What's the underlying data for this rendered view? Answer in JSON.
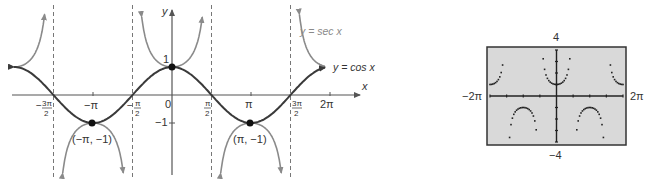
{
  "left_graph": {
    "axis_labels": {
      "x": "x",
      "y": "y"
    },
    "x_tick_labels": [
      {
        "num": "3π",
        "den": "2",
        "sign": "−",
        "value": "-3π/2"
      },
      {
        "text": "−π",
        "value": "-π"
      },
      {
        "num": "π",
        "den": "2",
        "sign": "−",
        "value": "-π/2"
      },
      {
        "text": "0",
        "value": "0"
      },
      {
        "num": "π",
        "den": "2",
        "sign": "",
        "value": "π/2"
      },
      {
        "text": "π",
        "value": "π"
      },
      {
        "num": "3π",
        "den": "2",
        "sign": "",
        "value": "3π/2"
      },
      {
        "text": "2π",
        "value": "2π"
      }
    ],
    "y_tick_labels": {
      "one": "1",
      "neg_one": "−1"
    },
    "curve_labels": {
      "sec": "y = sec x",
      "cos": "y = cos x"
    },
    "point_labels": {
      "left": "(−π, −1)",
      "right": "(π, −1)"
    },
    "colors": {
      "cos": "#3a3a3a",
      "sec": "#8a8a8a",
      "axis": "#555555",
      "asymptote": "#777777"
    }
  },
  "calculator": {
    "window": {
      "xmin": "−2π",
      "xmax": "2π",
      "ymin": "−4",
      "ymax": "4"
    },
    "colors": {
      "screen": "#d9d9d9",
      "border": "#333333",
      "plot": "#222222"
    }
  },
  "chart_data": [
    {
      "type": "line",
      "title": "",
      "xlabel": "x",
      "ylabel": "y",
      "xlim": [
        "-3π/2-ish",
        "2π"
      ],
      "ylim": [
        -3,
        3
      ],
      "x_ticks": [
        "-3π/2",
        "-π",
        "-π/2",
        "0",
        "π/2",
        "π",
        "3π/2",
        "2π"
      ],
      "y_ticks": [
        -1,
        1
      ],
      "series": [
        {
          "name": "y = cos x",
          "function": "cos(x)"
        },
        {
          "name": "y = sec x",
          "function": "sec(x)"
        }
      ],
      "asymptotes": [
        "x = -3π/2",
        "x = -π/2",
        "x = π/2",
        "x = 3π/2"
      ],
      "labeled_points": [
        {
          "label": "(−π, −1)",
          "x": "-π",
          "y": -1
        },
        {
          "label": "(0, 1)",
          "x": 0,
          "y": 1
        },
        {
          "label": "(π, −1)",
          "x": "π",
          "y": -1
        }
      ],
      "grid": false
    },
    {
      "type": "scatter",
      "title": "Graphing calculator: y = sec x",
      "function": "sec(x)",
      "xlim": [
        "-2π",
        "2π"
      ],
      "ylim": [
        -4,
        4
      ],
      "x_tick_labels": [
        "−2π",
        "2π"
      ],
      "y_tick_labels": [
        "4",
        "−4"
      ],
      "grid": false
    }
  ]
}
